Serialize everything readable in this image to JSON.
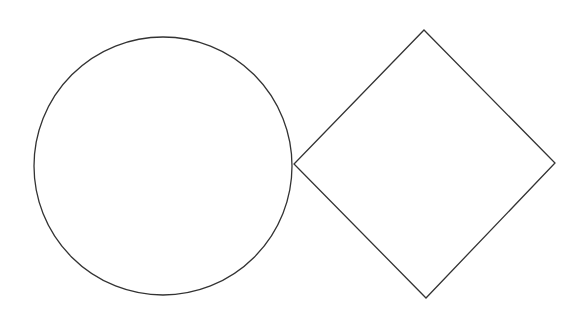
{
  "canvas": {
    "width": 588,
    "height": 326,
    "background": "#ffffff"
  },
  "shapes": [
    {
      "type": "circle",
      "name": "circle",
      "cx": 163,
      "cy": 166,
      "r": 129,
      "stroke": "#333333"
    },
    {
      "type": "diamond",
      "name": "diamond",
      "points": "424,30 555,163 426,298 294,164",
      "stroke": "#333333"
    }
  ]
}
